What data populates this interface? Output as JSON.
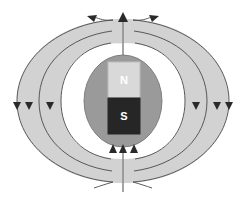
{
  "figure": {
    "title": "Dipole magnetic field of a sphere containing a bar magnet",
    "width": 248,
    "height": 206,
    "background_color": "#ffffff"
  },
  "sphere": {
    "name": "planet-sphere",
    "center_x": 123,
    "center_y": 101,
    "radius_x": 39,
    "radius_y": 46,
    "fill_color": "#9a9a9a",
    "stroke_color": "#6f6f6f"
  },
  "magnet": {
    "name": "bar-magnet",
    "x": 108,
    "y": 62,
    "width": 32,
    "height": 72,
    "outline_color": "#cfcfcf",
    "north": {
      "label": "N",
      "fill_color": "#d9d9d9",
      "text_color": "#ffffff",
      "height": 36
    },
    "south": {
      "label": "S",
      "fill_color": "#262626",
      "text_color": "#ffffff",
      "height": 36
    }
  },
  "field": {
    "name": "magnetic-field-lines",
    "lobe_fill_color": "#d2d2d2",
    "line_color": "#4a4a4a",
    "line_width": 0.9,
    "loop_count_per_side": 3,
    "loops": [
      {
        "half_width": 106,
        "half_height": 82
      },
      {
        "half_width": 84,
        "half_height": 70
      },
      {
        "half_width": 62,
        "half_height": 58
      }
    ],
    "axis_line": {
      "name": "polar-axis-line",
      "x": 123,
      "top_y": 14,
      "bottom_y": 192,
      "color": "#8f8f8f"
    }
  },
  "arrows": {
    "top": [
      {
        "name": "arrow-top-left",
        "direction": "up-left",
        "x": 91,
        "y": 18
      },
      {
        "name": "arrow-top-center",
        "direction": "up",
        "x": 123,
        "y": 14
      },
      {
        "name": "arrow-top-right",
        "direction": "up-right",
        "x": 155,
        "y": 18
      }
    ],
    "bottom": [
      {
        "name": "arrow-bottom-left",
        "direction": "up",
        "x": 113,
        "y": 146
      },
      {
        "name": "arrow-bottom-center",
        "direction": "up",
        "x": 123,
        "y": 146
      },
      {
        "name": "arrow-bottom-right",
        "direction": "up",
        "x": 133,
        "y": 146
      }
    ],
    "left": [
      {
        "name": "arrow-left-outer",
        "direction": "down",
        "x": 15,
        "y": 106
      },
      {
        "name": "arrow-left-middle",
        "direction": "down",
        "x": 27,
        "y": 106
      },
      {
        "name": "arrow-left-inner",
        "direction": "down",
        "x": 48,
        "y": 106
      }
    ],
    "right": [
      {
        "name": "arrow-right-inner",
        "direction": "down",
        "x": 198,
        "y": 106
      },
      {
        "name": "arrow-right-middle",
        "direction": "down",
        "x": 219,
        "y": 106
      },
      {
        "name": "arrow-right-outer",
        "direction": "down",
        "x": 231,
        "y": 106
      }
    ],
    "head_color": "#2a2a2a",
    "head_size": 5
  }
}
